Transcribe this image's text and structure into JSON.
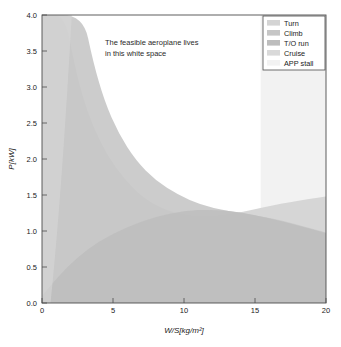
{
  "chart_data": {
    "type": "area",
    "title": "",
    "xlabel": "W/S[kg/m²]",
    "ylabel": "P[kW]",
    "xlim": [
      0,
      20
    ],
    "ylim": [
      0,
      4.0
    ],
    "xticks": [
      "0",
      "5",
      "10",
      "15",
      "20"
    ],
    "xtick_values": [
      0,
      5,
      10,
      15,
      20
    ],
    "yticks": [
      "0.0",
      "0.5",
      "1.0",
      "1.5",
      "2.0",
      "2.5",
      "3.0",
      "3.5",
      "4.0"
    ],
    "ytick_values": [
      0.0,
      0.5,
      1.0,
      1.5,
      2.0,
      2.5,
      3.0,
      3.5,
      4.0
    ],
    "grid": false,
    "legend_position": "upper right",
    "annotation": {
      "line1": "The feasible aeroplane lives",
      "line2": "in this white space",
      "x": 4.4,
      "y": 3.72
    },
    "series": [
      {
        "name": "Turn",
        "type": "infeasible-region-below-curve",
        "color": "#d4d4d4",
        "description": "Hyperbolic boundary; region left/below of curve is infeasible",
        "curve": [
          {
            "x": 0.0,
            "y": 4.0
          },
          {
            "x": 1.6,
            "y": 4.0
          },
          {
            "x": 2.2,
            "y": 3.4
          },
          {
            "x": 2.8,
            "y": 2.9
          },
          {
            "x": 3.6,
            "y": 2.45
          },
          {
            "x": 4.6,
            "y": 2.05
          },
          {
            "x": 5.8,
            "y": 1.72
          },
          {
            "x": 7.2,
            "y": 1.45
          },
          {
            "x": 8.8,
            "y": 1.28
          },
          {
            "x": 10.6,
            "y": 1.2
          },
          {
            "x": 12.0,
            "y": 1.2
          },
          {
            "x": 13.6,
            "y": 1.24
          },
          {
            "x": 15.4,
            "y": 1.32
          },
          {
            "x": 17.4,
            "y": 1.4
          },
          {
            "x": 20.0,
            "y": 1.48
          }
        ]
      },
      {
        "name": "Climb",
        "type": "infeasible-region-below-curve",
        "color": "#c6c6c6",
        "description": "Hyperbolic boundary offset left of Turn curve",
        "curve": [
          {
            "x": 0.0,
            "y": 4.0
          },
          {
            "x": 2.9,
            "y": 4.0
          },
          {
            "x": 3.6,
            "y": 3.35
          },
          {
            "x": 4.4,
            "y": 2.8
          },
          {
            "x": 5.4,
            "y": 2.35
          },
          {
            "x": 6.6,
            "y": 1.98
          },
          {
            "x": 8.0,
            "y": 1.7
          },
          {
            "x": 9.6,
            "y": 1.5
          },
          {
            "x": 11.2,
            "y": 1.36
          },
          {
            "x": 13.0,
            "y": 1.28
          },
          {
            "x": 15.0,
            "y": 1.22
          },
          {
            "x": 17.0,
            "y": 1.14
          },
          {
            "x": 20.0,
            "y": 0.98
          }
        ]
      },
      {
        "name": "T/O run",
        "type": "infeasible-region-below-curve",
        "color": "#bdbdbd",
        "description": "Lower dome-shaped boundary across the bottom of the chart",
        "curve": [
          {
            "x": 0.0,
            "y": 0.1
          },
          {
            "x": 1.2,
            "y": 0.38
          },
          {
            "x": 2.4,
            "y": 0.62
          },
          {
            "x": 4.0,
            "y": 0.86
          },
          {
            "x": 6.0,
            "y": 1.06
          },
          {
            "x": 8.0,
            "y": 1.2
          },
          {
            "x": 10.0,
            "y": 1.28
          },
          {
            "x": 12.0,
            "y": 1.3
          },
          {
            "x": 14.0,
            "y": 1.26
          },
          {
            "x": 16.0,
            "y": 1.18
          },
          {
            "x": 18.0,
            "y": 1.08
          },
          {
            "x": 20.0,
            "y": 0.97
          }
        ]
      },
      {
        "name": "Cruise",
        "type": "infeasible-region-left-of-curve",
        "color": "#d9d9d9",
        "description": "Steep boundary rising on the left side of the plot",
        "curve": [
          {
            "x": 0.6,
            "y": 0.0
          },
          {
            "x": 0.9,
            "y": 0.6
          },
          {
            "x": 1.2,
            "y": 1.3
          },
          {
            "x": 1.5,
            "y": 2.1
          },
          {
            "x": 1.8,
            "y": 3.0
          },
          {
            "x": 2.1,
            "y": 4.0
          }
        ]
      },
      {
        "name": "APP stall",
        "type": "infeasible-region-right-of-line",
        "color": "#f2f2f2",
        "description": "Vertical boundary at W/S = 15.4; region to the right is shaded",
        "x_boundary": 15.4
      }
    ],
    "legend_entries": [
      {
        "label": "Turn",
        "color": "#d4d4d4"
      },
      {
        "label": "Climb",
        "color": "#c6c6c6"
      },
      {
        "label": "T/O run",
        "color": "#bdbdbd"
      },
      {
        "label": "Cruise",
        "color": "#d9d9d9"
      },
      {
        "label": "APP stall",
        "color": "#f2f2f2"
      }
    ]
  }
}
